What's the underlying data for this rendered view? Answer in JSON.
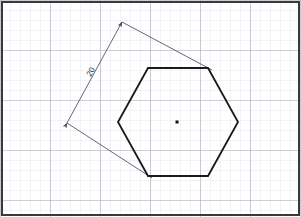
{
  "canvas": {
    "width": 301,
    "height": 217,
    "background_color": "#ffffff",
    "title": "Hexagon with dimension line on graph paper"
  },
  "grid": {
    "minor_spacing_px": 10,
    "major_every": 5,
    "minor_color": "#dcdce4",
    "major_color": "#a8a8b8",
    "minor_width": 0.7,
    "major_width": 1.1,
    "visible": true
  },
  "border": {
    "color": "#3a3a3a",
    "width": 2.0,
    "inset_px": 2,
    "visible": true
  },
  "shapes": {
    "hexagon": {
      "name": "regular-hexagon",
      "stroke_color": "#1a1a1a",
      "stroke_width": 1.8,
      "fill": "none",
      "points": "148,68 208,68 238,122 208,176 148,176 118,122",
      "vertices": [
        {
          "label": "top-left",
          "x": 148,
          "y": 68
        },
        {
          "label": "top-right",
          "x": 208,
          "y": 68
        },
        {
          "label": "right",
          "x": 238,
          "y": 122
        },
        {
          "label": "bottom-right",
          "x": 208,
          "y": 176
        },
        {
          "label": "bottom-left",
          "x": 148,
          "y": 176
        },
        {
          "label": "left",
          "x": 118,
          "y": 122
        }
      ]
    },
    "center_point": {
      "name": "hexagon-center-dot",
      "x": 177,
      "y": 122,
      "size_px": 3,
      "color": "#111111"
    }
  },
  "dimension": {
    "label": "20",
    "label_x": 93,
    "label_y": 73,
    "label_rotation_deg": -61,
    "line_color": "#555566",
    "line_width": 0.9,
    "arrow_color": "#444455",
    "start": {
      "x": 67,
      "y": 123
    },
    "end": {
      "x": 122,
      "y": 22
    },
    "extension_lines": [
      {
        "name": "upper-extension-line",
        "from_x": 122,
        "from_y": 22,
        "to_x": 212,
        "to_y": 70
      },
      {
        "name": "lower-extension-line",
        "from_x": 67,
        "from_y": 123,
        "to_x": 152,
        "to_y": 178
      }
    ]
  }
}
